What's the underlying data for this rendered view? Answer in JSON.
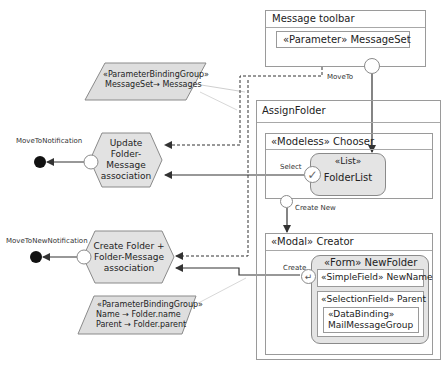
{
  "message_toolbar": {
    "title": "Message toolbar",
    "parameter": "«Parameter» MessageSet",
    "move_to_label": "MoveTo"
  },
  "param_binding_1": {
    "stereotype": "«ParameterBindingGroup»",
    "lines": [
      "MessageSet→ Messages"
    ]
  },
  "param_binding_2": {
    "stereotype": "«ParameterBindingGroup»",
    "lines": [
      "Name → Folder.name",
      "Parent → Folder.parent"
    ]
  },
  "actions": [
    {
      "label_lines": [
        "Update",
        "Folder-",
        "Message",
        "association"
      ],
      "notification": "MoveToNotification"
    },
    {
      "label_lines": [
        "Create Folder +",
        "Folder-Message",
        "association"
      ],
      "notification": "MoveToNewNotification"
    }
  ],
  "assign_folder": {
    "title": "AssignFolder",
    "chooser": {
      "title": "«Modeless» Chooser",
      "list_stereotype": "«List»",
      "list_name": "FolderList",
      "select_label": "Select",
      "create_new_label": "Create New"
    },
    "creator": {
      "title": "«Modal» Creator",
      "create_label": "Create",
      "form_title": "«Form» NewFolder",
      "simple_field": "«SimpleField» NewName",
      "selection_field": "«SelectionField» Parent",
      "data_binding_stereotype": "«DataBinding»",
      "data_binding_name": "MailMessageGroup"
    }
  }
}
